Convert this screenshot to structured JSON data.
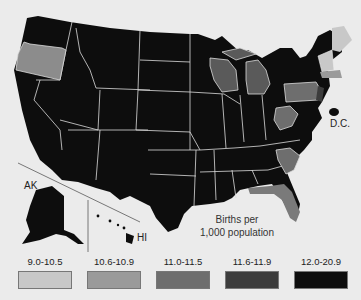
{
  "map": {
    "title_note": "Births per 1,000 population",
    "note_line1": "Births per",
    "note_line2": "1,000 population",
    "labels": {
      "ak": "AK",
      "hi": "HI",
      "dc": "D.C."
    }
  },
  "legend": [
    {
      "label": "9.0-10.5",
      "color": "#c8c8c8"
    },
    {
      "label": "10.6-10.9",
      "color": "#9a9a9a"
    },
    {
      "label": "11.0-11.5",
      "color": "#6e6e6e"
    },
    {
      "label": "11.6-11.9",
      "color": "#3c3c3c"
    },
    {
      "label": "12.0-20.9",
      "color": "#0d0d0d"
    }
  ],
  "states": {
    "oregon": "10.6-10.9",
    "wisconsin": "11.0-11.5",
    "michigan": "11.0-11.5",
    "pennsylvania": "11.0-11.5",
    "west_virginia": "11.0-11.5",
    "south_carolina": "11.0-11.5",
    "florida": "11.0-11.5",
    "maine": "9.0-10.5",
    "vermont": "9.0-10.5",
    "new_hampshire": "9.0-10.5",
    "massachusetts": "10.6-10.9",
    "rhode_island": "10.6-10.9",
    "connecticut": "11.0-11.5",
    "new_jersey": "11.6-11.9",
    "delaware": "11.6-11.9",
    "maryland": "12.0-20.9",
    "dc": "12.0-20.9",
    "other": "12.0-20.9"
  }
}
